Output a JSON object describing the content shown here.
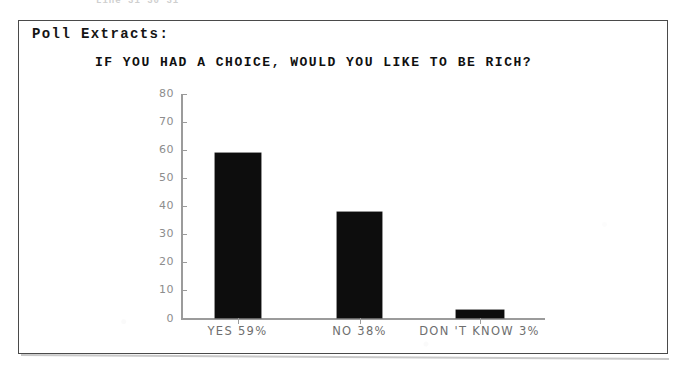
{
  "page": {
    "top_partial_text": "Line 31 30 31",
    "box_label": "Poll Extracts:"
  },
  "chart_data": {
    "type": "bar",
    "title": "IF YOU HAD A CHOICE, WOULD YOU LIKE TO BE RICH?",
    "xlabel": "",
    "ylabel": "",
    "ylim": [
      0,
      80
    ],
    "grid": false,
    "legend": null,
    "bar_color": "#0d0d0d",
    "axis_color": "#9b9b9b",
    "categories": [
      "YES",
      "NO",
      "DON'T KNOW"
    ],
    "tick_labels": [
      "YES  59%",
      "NO  38%",
      "DON 'T  KNOW  3%"
    ],
    "values": [
      59,
      38,
      3
    ],
    "yticks": [
      0,
      10,
      20,
      30,
      40,
      50,
      60,
      70,
      80
    ],
    "ytick_labels": [
      "0",
      "10",
      "20",
      "30",
      "40",
      "50",
      "60",
      "70",
      "80"
    ]
  }
}
